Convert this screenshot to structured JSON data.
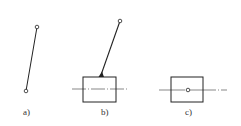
{
  "figures": [
    {
      "id": "a",
      "label": "a)",
      "description": "free link with two pin joints"
    },
    {
      "id": "b",
      "label": "b)",
      "description": "link fixed to a slider block on a guide line"
    },
    {
      "id": "c",
      "label": "c)",
      "description": "slider block with pin joint on guide line"
    }
  ],
  "colors": {
    "stroke": "#222222",
    "centerline": "#555555",
    "background": "#ffffff"
  }
}
